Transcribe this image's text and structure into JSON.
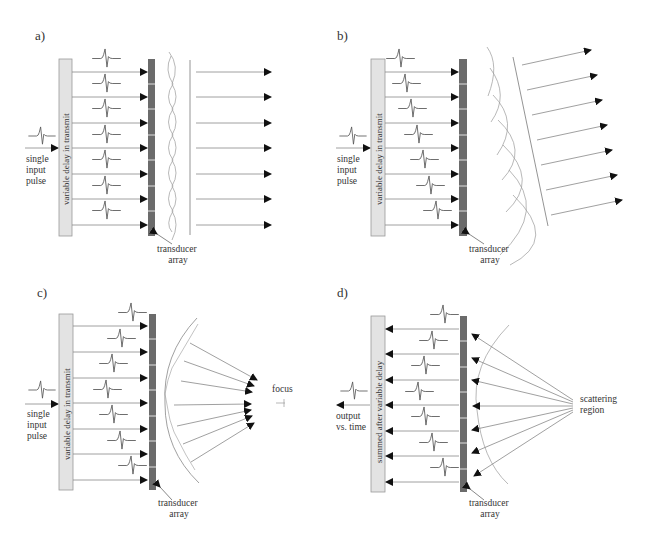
{
  "colors": {
    "delay_box_fill": "#e3e3e3",
    "delay_box_stroke": "#9a9a9a",
    "transducer_fill": "#6b6b6b",
    "line": "#888888",
    "arrowhead": "#111111",
    "text": "#333333"
  },
  "panels": [
    {
      "id": "a",
      "label": "a)",
      "delay_label": "variable delay in transmit",
      "input_label": [
        "single",
        "input",
        "pulse"
      ],
      "transducer_label": [
        "transducer",
        "array"
      ],
      "description": "unsteered plane wave"
    },
    {
      "id": "b",
      "label": "b)",
      "delay_label": "variable delay in transmit",
      "input_label": [
        "single",
        "input",
        "pulse"
      ],
      "transducer_label": [
        "transducer",
        "array"
      ],
      "description": "steered plane wave"
    },
    {
      "id": "c",
      "label": "c)",
      "delay_label": "variable delay in transmit",
      "input_label": [
        "single",
        "input",
        "pulse"
      ],
      "transducer_label": [
        "transducer",
        "array"
      ],
      "focus_label": "focus",
      "description": "focused transmit"
    },
    {
      "id": "d",
      "label": "d)",
      "delay_label": "summed after variable delay",
      "output_label": [
        "output",
        "vs. time"
      ],
      "transducer_label": [
        "transducer",
        "array"
      ],
      "scatter_label": [
        "scattering",
        "region"
      ],
      "description": "receive beamforming"
    }
  ],
  "element_count": 7
}
